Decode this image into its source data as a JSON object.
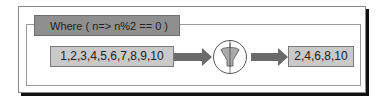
{
  "diagram": {
    "header": "Where ( n=> n%2 == 0 )",
    "input": "1,2,3,4,5,6,7,8,9,10",
    "filter_icon": "funnel-icon",
    "output": "2,4,6,8,10",
    "colors": {
      "header_bg": "#8f8f8f",
      "box_bg": "#c9c9c9",
      "arrow": "#6a6a6a",
      "shadow": "#111111"
    }
  }
}
